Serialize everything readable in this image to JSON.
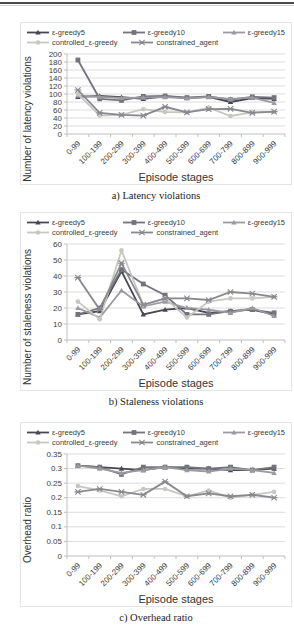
{
  "page": {
    "top_rule": "page-top-rule"
  },
  "chart_data": [
    {
      "type": "line",
      "caption": "a) Latency violations",
      "xlabel": "Episode stages",
      "ylabel": "Number of latency violations",
      "ylim": [
        0,
        200
      ],
      "yticks": [
        0,
        20,
        40,
        60,
        80,
        100,
        120,
        140,
        160,
        180,
        200
      ],
      "grid": true,
      "legend_position": "top",
      "categories": [
        "0-99",
        "100-199",
        "200-299",
        "300-399",
        "400-499",
        "500-599",
        "600-699",
        "700-799",
        "800-899",
        "900-999"
      ],
      "series": [
        {
          "name": "ε-greedy5",
          "color": "#474754",
          "marker": "triangle",
          "values": [
            93,
            95,
            92,
            88,
            94,
            90,
            93,
            80,
            90,
            88
          ]
        },
        {
          "name": "ε-greedy10",
          "color": "#73737b",
          "marker": "square",
          "values": [
            185,
            88,
            84,
            94,
            95,
            91,
            94,
            86,
            93,
            91
          ]
        },
        {
          "name": "ε-greedy15",
          "color": "#9a9aa0",
          "marker": "triangle",
          "values": [
            96,
            93,
            90,
            91,
            92,
            89,
            92,
            88,
            91,
            78
          ]
        },
        {
          "name": "controlled_ε-greedy",
          "color": "#c7c7c2",
          "marker": "circle",
          "values": [
            100,
            46,
            48,
            62,
            55,
            54,
            66,
            45,
            54,
            55
          ]
        },
        {
          "name": "constrained_agent",
          "color": "#88888f",
          "marker": "x",
          "values": [
            110,
            53,
            48,
            46,
            68,
            54,
            62,
            63,
            53,
            56
          ]
        }
      ]
    },
    {
      "type": "line",
      "caption": "b) Staleness violations",
      "xlabel": "Episode stages",
      "ylabel": "Number of staleness violations",
      "ylim": [
        0,
        60
      ],
      "yticks": [
        0,
        10,
        20,
        30,
        40,
        50,
        60
      ],
      "grid": true,
      "legend_position": "top",
      "categories": [
        "0-99",
        "100-199",
        "200-299",
        "300-399",
        "400-499",
        "500-599",
        "600-699",
        "700-799",
        "800-899",
        "900-999"
      ],
      "series": [
        {
          "name": "ε-greedy5",
          "color": "#474754",
          "marker": "triangle",
          "values": [
            16,
            18,
            43,
            16,
            19,
            20,
            17,
            18,
            19,
            16
          ]
        },
        {
          "name": "ε-greedy10",
          "color": "#73737b",
          "marker": "square",
          "values": [
            16,
            20,
            44,
            35,
            28,
            16,
            16,
            18,
            19,
            17
          ]
        },
        {
          "name": "ε-greedy15",
          "color": "#9a9aa0",
          "marker": "triangle",
          "values": [
            20,
            14,
            31,
            21,
            24,
            20,
            19,
            17,
            20,
            15
          ]
        },
        {
          "name": "controlled_ε-greedy",
          "color": "#c7c7c2",
          "marker": "circle",
          "values": [
            24,
            13,
            56,
            22,
            26,
            14,
            24,
            26,
            26,
            27
          ]
        },
        {
          "name": "constrained_agent",
          "color": "#88888f",
          "marker": "x",
          "values": [
            39,
            19,
            48,
            22,
            26,
            26,
            25,
            30,
            29,
            27
          ]
        }
      ]
    },
    {
      "type": "line",
      "caption": "c) Overhead ratio",
      "xlabel": "Episode stages",
      "ylabel": "Overhead ratio",
      "ylim": [
        0,
        0.35
      ],
      "yticks": [
        0,
        0.05,
        0.1,
        0.15,
        0.2,
        0.25,
        0.3,
        0.35
      ],
      "grid": true,
      "legend_position": "top",
      "categories": [
        "0-99",
        "100-199",
        "200-299",
        "300-399",
        "400-499",
        "500-599",
        "600-699",
        "700-799",
        "800-899",
        "900-999"
      ],
      "series": [
        {
          "name": "ε-greedy5",
          "color": "#474754",
          "marker": "triangle",
          "values": [
            0.31,
            0.305,
            0.3,
            0.295,
            0.305,
            0.3,
            0.3,
            0.295,
            0.295,
            0.3
          ]
        },
        {
          "name": "ε-greedy10",
          "color": "#73737b",
          "marker": "square",
          "values": [
            0.31,
            0.305,
            0.28,
            0.305,
            0.305,
            0.305,
            0.3,
            0.305,
            0.295,
            0.305
          ]
        },
        {
          "name": "ε-greedy15",
          "color": "#9a9aa0",
          "marker": "triangle",
          "values": [
            0.31,
            0.3,
            0.285,
            0.295,
            0.305,
            0.295,
            0.29,
            0.3,
            0.295,
            0.285
          ]
        },
        {
          "name": "controlled_ε-greedy",
          "color": "#c7c7c2",
          "marker": "circle",
          "values": [
            0.24,
            0.225,
            0.205,
            0.23,
            0.23,
            0.205,
            0.225,
            0.2,
            0.21,
            0.22
          ]
        },
        {
          "name": "constrained_agent",
          "color": "#88888f",
          "marker": "x",
          "values": [
            0.22,
            0.23,
            0.22,
            0.21,
            0.255,
            0.205,
            0.215,
            0.205,
            0.21,
            0.2
          ]
        }
      ]
    }
  ]
}
